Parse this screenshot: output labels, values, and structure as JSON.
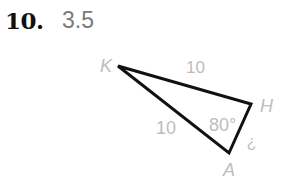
{
  "problem": {
    "number": "10.",
    "answer": "3.5"
  },
  "figure": {
    "vertices": {
      "K": {
        "label": "K",
        "x": 118,
        "y": 66
      },
      "H": {
        "label": "H",
        "x": 251,
        "y": 104
      },
      "A": {
        "label": "A",
        "x": 229,
        "y": 153
      }
    },
    "side_KH": "10",
    "side_KA": "10",
    "angle_A": "80°",
    "side_HA": "?",
    "stroke_color": "#111111",
    "label_color": "#bdbdbd"
  }
}
